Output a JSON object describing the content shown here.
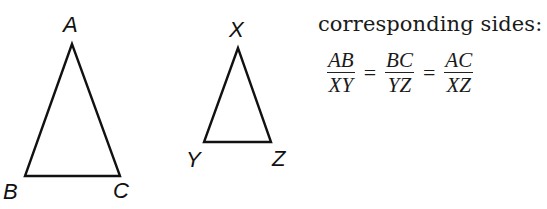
{
  "diagram": {
    "triangle_large": {
      "vertices": {
        "A": {
          "label": "A",
          "x": 72,
          "y": 44
        },
        "B": {
          "label": "B",
          "x": 25,
          "y": 176
        },
        "C": {
          "label": "C",
          "x": 120,
          "y": 176
        }
      }
    },
    "triangle_small": {
      "vertices": {
        "X": {
          "label": "X",
          "x": 238,
          "y": 48
        },
        "Y": {
          "label": "Y",
          "x": 204,
          "y": 142
        },
        "Z": {
          "label": "Z",
          "x": 271,
          "y": 142
        }
      }
    },
    "stroke_color": "#111111"
  },
  "text": {
    "caption": "corresponding sides:",
    "ratios": [
      {
        "numerator": "AB",
        "denominator": "XY"
      },
      {
        "numerator": "BC",
        "denominator": "YZ"
      },
      {
        "numerator": "AC",
        "denominator": "XZ"
      }
    ],
    "equals": "="
  }
}
